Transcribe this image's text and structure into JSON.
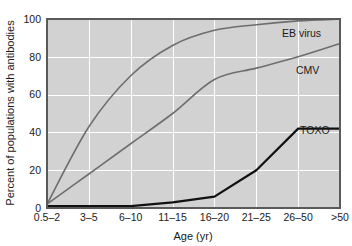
{
  "chart_data": {
    "type": "line",
    "title": "",
    "xlabel": "Age (yr)",
    "ylabel": "Percent of populations with antibodies",
    "categories": [
      "0.5–2",
      "3–5",
      "6–10",
      "11–15",
      "16–20",
      "21–25",
      "26–50",
      ">50"
    ],
    "ylim": [
      0,
      100
    ],
    "yticks": [
      0,
      20,
      40,
      60,
      80,
      100
    ],
    "ytick_labels": [
      "0",
      "20",
      "40",
      "60",
      "80",
      "100"
    ],
    "grid": true,
    "legend_position": "inline-right",
    "series": [
      {
        "name": "EB virus",
        "color": "#6e6e6e",
        "width": 1.6,
        "values": [
          2,
          43,
          70,
          86,
          94,
          97,
          99,
          100
        ]
      },
      {
        "name": "CMV",
        "color": "#6e6e6e",
        "width": 1.6,
        "values": [
          2,
          18,
          34,
          50,
          68,
          74,
          80,
          87
        ]
      },
      {
        "name": "TOXO",
        "color": "#111111",
        "width": 2.2,
        "values": [
          1,
          1,
          1,
          3,
          6,
          20,
          42,
          42
        ]
      }
    ],
    "annotations": [
      {
        "text": "EB virus",
        "series": "EB virus"
      },
      {
        "text": "CMV",
        "series": "CMV"
      },
      {
        "text": "TOXO",
        "series": "TOXO"
      }
    ]
  },
  "layout": {
    "plot": {
      "left": 47,
      "top": 19,
      "right": 340,
      "bottom": 208
    },
    "background_color": "#d2d2d2",
    "gridline_color": "#ffffff",
    "border_color": "#5a5a5a",
    "label_offsets": [
      {
        "name": "EB virus",
        "x": 282,
        "y": 37
      },
      {
        "name": "CMV",
        "x": 296,
        "y": 74
      },
      {
        "name": "TOXO",
        "x": 300,
        "y": 134
      }
    ]
  }
}
